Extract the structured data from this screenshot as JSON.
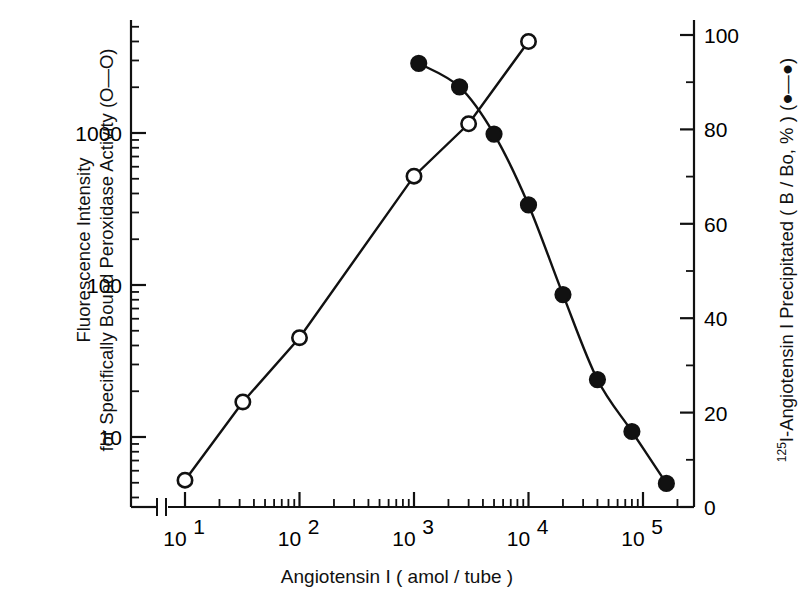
{
  "figure": {
    "background": "#ffffff",
    "ink_color": "#111111"
  },
  "axes": {
    "x": {
      "title": "Angiotensin I ( amol / tube )",
      "scale": "log",
      "tick_labels": [
        "10",
        "10",
        "10",
        "10",
        "10"
      ],
      "tick_exponents": [
        "1",
        "2",
        "3",
        "4",
        "5"
      ],
      "tick_values": [
        10,
        100,
        1000,
        10000,
        100000
      ],
      "range": [
        10,
        200000
      ],
      "axis_break": true
    },
    "y_left": {
      "title_line1": "Fluorescence Intensity",
      "title_line2": "for Specifically Bound Peroxidase Activity (O—O)",
      "scale": "log",
      "tick_labels": [
        "10",
        "100",
        "1000"
      ],
      "tick_values": [
        10,
        100,
        1000
      ],
      "range": [
        4,
        5000
      ]
    },
    "y_right": {
      "title_prefix": "125",
      "title_main": "I-Angiotensin I Precipitated ( B / Bo, % ) (●—●)",
      "scale": "linear",
      "tick_labels": [
        "0",
        "20",
        "40",
        "60",
        "80",
        "100"
      ],
      "tick_values": [
        0,
        20,
        40,
        60,
        80,
        100
      ],
      "range": [
        0,
        100
      ]
    }
  },
  "chart_data": {
    "type": "line",
    "title": "",
    "xlabel": "Angiotensin I ( amol / tube )",
    "ylabel": "Fluorescence Intensity for Specifically Bound Peroxidase Activity (O—O)",
    "ylabel_right": "125I-Angiotensin I Precipitated ( B / Bo, % ) (●—●)",
    "xscale": "log",
    "yscale_left": "log",
    "yscale_right": "linear",
    "xlim": [
      10,
      200000
    ],
    "ylim_left": [
      4,
      5000
    ],
    "ylim_right": [
      0,
      100
    ],
    "grid": false,
    "legend_position": "in-axis-titles",
    "series": [
      {
        "name": "Fluorescence Intensity for Specifically Bound Peroxidase Activity",
        "marker": "open-circle",
        "axis": "left",
        "x": [
          10,
          32,
          100,
          1000,
          3000,
          10000
        ],
        "y": [
          5.2,
          17,
          45,
          520,
          1150,
          4000
        ]
      },
      {
        "name": "125I-Angiotensin I Precipitated (B / Bo, %)",
        "marker": "filled-circle",
        "axis": "right",
        "x": [
          1100,
          2500,
          5000,
          10000,
          20000,
          40000,
          80000,
          160000
        ],
        "y": [
          94,
          89,
          79,
          64,
          45,
          27,
          16,
          5
        ]
      }
    ]
  }
}
